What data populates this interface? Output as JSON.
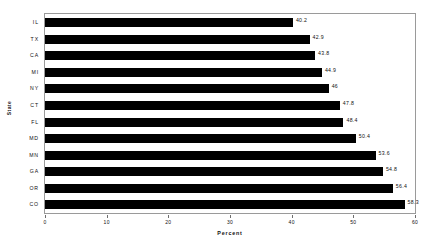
{
  "chart_data": {
    "type": "bar",
    "orientation": "horizontal",
    "title": "",
    "xlabel": "Percent",
    "ylabel": "State",
    "categories": [
      "IL",
      "TX",
      "CA",
      "MI",
      "NY",
      "CT",
      "FL",
      "MD",
      "MN",
      "GA",
      "OR",
      "CO"
    ],
    "values": [
      40.2,
      42.9,
      43.8,
      44.9,
      46,
      47.8,
      48.4,
      50.4,
      53.6,
      54.8,
      56.4,
      58.3
    ],
    "value_labels": [
      "40.2",
      "42.9",
      "43.8",
      "44.9",
      "46",
      "47.8",
      "48.4",
      "50.4",
      "53.6",
      "54.8",
      "56.4",
      "58.3"
    ],
    "xlim": [
      0,
      60
    ],
    "xticks": [
      0,
      10,
      20,
      30,
      40,
      50,
      60
    ],
    "xtick_labels": [
      "0",
      "10",
      "20",
      "30",
      "40",
      "50",
      "60"
    ],
    "grid": false,
    "legend": false,
    "bar_color": "#000000",
    "frame_color": "#9a9a9a",
    "background": "#ffffff"
  }
}
